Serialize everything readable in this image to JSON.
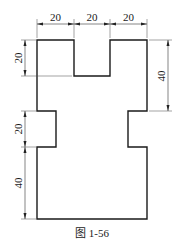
{
  "figure": {
    "caption": "图 1-56",
    "units": "mm",
    "part_outline": {
      "description": "symmetric H-like plate profile with top notch and side waist cutouts",
      "overall_width": 60,
      "overall_height": 100
    },
    "dimensions": {
      "top": [
        {
          "id": "top-left-width",
          "value": "20"
        },
        {
          "id": "top-middle-notch-width",
          "value": "20"
        },
        {
          "id": "top-right-width",
          "value": "20"
        }
      ],
      "left": [
        {
          "id": "notch-depth",
          "value": "20"
        },
        {
          "id": "waist-height",
          "value": "20"
        },
        {
          "id": "base-height",
          "value": "40"
        }
      ],
      "right": [
        {
          "id": "upper-block-height",
          "value": "40"
        }
      ]
    }
  }
}
